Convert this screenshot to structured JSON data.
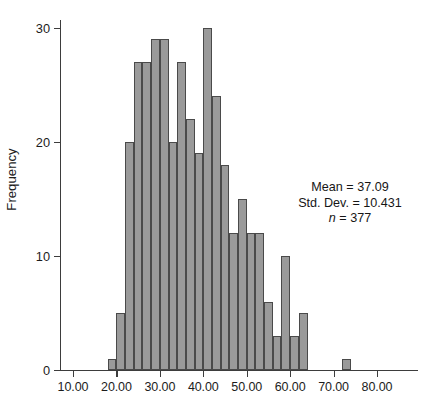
{
  "chart_data": {
    "type": "bar",
    "subtype": "histogram",
    "title": "",
    "xlabel": "",
    "ylabel": "Frequency",
    "xlim": [
      5,
      85
    ],
    "ylim": [
      0,
      31
    ],
    "grid": false,
    "legend": null,
    "bin_width": 2,
    "x_tick_labels": [
      "10.00",
      "20.00",
      "30.00",
      "40.00",
      "50.00",
      "60.00",
      "70.00",
      "80.00"
    ],
    "x_ticks": [
      10,
      20,
      30,
      40,
      50,
      60,
      70,
      80
    ],
    "y_tick_labels": [
      "0",
      "10",
      "20",
      "30"
    ],
    "y_ticks": [
      0,
      10,
      20,
      30
    ],
    "bin_starts": [
      18,
      20,
      22,
      24,
      26,
      28,
      30,
      32,
      34,
      36,
      38,
      40,
      42,
      44,
      46,
      48,
      50,
      52,
      54,
      56,
      58,
      60,
      62,
      72
    ],
    "bin_centers": [
      19,
      21,
      23,
      25,
      27,
      29,
      31,
      33,
      35,
      37,
      39,
      41,
      43,
      45,
      47,
      49,
      51,
      53,
      55,
      57,
      59,
      61,
      63,
      73
    ],
    "values": [
      1,
      5,
      20,
      27,
      27,
      29,
      29,
      20,
      27,
      22,
      19,
      30,
      24,
      18,
      12,
      15,
      12,
      12,
      6,
      3,
      10,
      3,
      5,
      1
    ],
    "bar_fill_color": "#9a9a9a",
    "bar_edge_color": "#4a4a4a",
    "axis_color": "#3d3d3d"
  },
  "annotation": {
    "mean_label": "Mean = 37.09",
    "std_dev_label": "Std. Dev. = 10.431",
    "n_symbol": "n",
    "n_value_label": " = 377"
  }
}
